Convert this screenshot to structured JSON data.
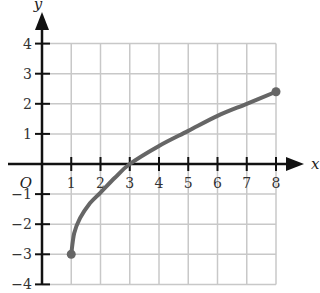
{
  "chart_data": {
    "type": "line",
    "title": "",
    "xlabel": "x",
    "ylabel": "y",
    "origin_label": "O",
    "xlim": [
      0,
      8
    ],
    "ylim": [
      -4,
      4
    ],
    "grid": true,
    "x_ticks": [
      "1",
      "2",
      "3",
      "4",
      "5",
      "6",
      "7",
      "8"
    ],
    "y_ticks": [
      "4",
      "3",
      "2",
      "1",
      "-1",
      "-2",
      "-3",
      "-4"
    ],
    "series": [
      {
        "name": "curve",
        "color": "#666666",
        "x": [
          1,
          1.1,
          1.3,
          1.6,
          2,
          2.5,
          3,
          4,
          5,
          6,
          7,
          8
        ],
        "y": [
          -3,
          -2.3,
          -1.8,
          -1.35,
          -0.95,
          -0.45,
          0,
          0.6,
          1.1,
          1.6,
          2.0,
          2.4
        ],
        "endpoints": [
          {
            "x": 1,
            "y": -3
          },
          {
            "x": 8,
            "y": 2.4
          }
        ]
      }
    ]
  }
}
